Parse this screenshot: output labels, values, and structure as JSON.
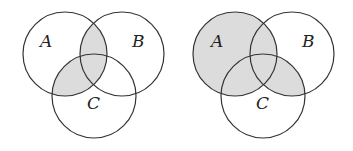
{
  "diagrams": [
    {
      "id": "left",
      "description": "A ∩ (B ∪ C) shaded",
      "circles": [
        {
          "label": "A",
          "cx": 65,
          "cy": 54,
          "r": 42,
          "lx": 40,
          "ly": 47
        },
        {
          "label": "B",
          "cx": 122,
          "cy": 54,
          "r": 42,
          "lx": 132,
          "ly": 47
        },
        {
          "label": "C",
          "cx": 94,
          "cy": 96,
          "r": 42,
          "lx": 87,
          "ly": 109
        }
      ],
      "shaded": [
        "A∩B",
        "A∩C"
      ]
    },
    {
      "id": "right",
      "description": "A ∪ (B ∩ C) shaded",
      "circles": [
        {
          "label": "A",
          "cx": 235,
          "cy": 54,
          "r": 42,
          "lx": 211,
          "ly": 47
        },
        {
          "label": "B",
          "cx": 292,
          "cy": 54,
          "r": 42,
          "lx": 302,
          "ly": 47
        },
        {
          "label": "C",
          "cx": 263,
          "cy": 96,
          "r": 42,
          "lx": 256,
          "ly": 109
        }
      ],
      "shaded": [
        "A",
        "B∩C"
      ]
    }
  ],
  "colors": {
    "shade": "#dcdcdc",
    "stroke": "#333333"
  }
}
